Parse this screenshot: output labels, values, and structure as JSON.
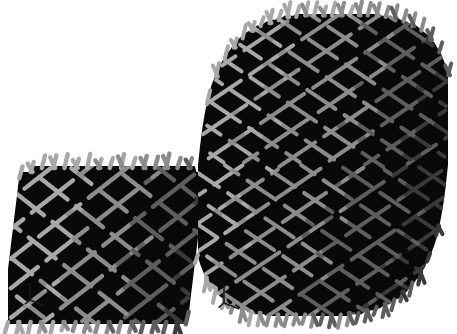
{
  "figure": {
    "background_color": "#ffffff",
    "caption": "",
    "render_type": "3d-woven-lattice-structures"
  },
  "palette": {
    "strand_light": "#a8a8a8",
    "strand_mid": "#8c8c8c",
    "strand_dark": "#5e5e5e",
    "strand_shadow": "#3a3a3a",
    "void_black": "#090909",
    "axis_color": "#1a1a1a",
    "background": "#ffffff"
  },
  "specimens": [
    {
      "id": "small-lattice",
      "name": "small-woven-lattice-specimen",
      "label": "",
      "bounds": {
        "x": 8,
        "y": 166,
        "width": 192,
        "height": 158
      },
      "shape": "cuboid",
      "weave": {
        "rows": 13,
        "cols": 15,
        "strand_thickness": 4.4,
        "diagonal_angle_a": -38,
        "diagonal_angle_b": 38
      },
      "axis_triad": {
        "name": "axis-triad-small",
        "origin": {
          "x": 30,
          "y": 300
        },
        "arm_length": 17,
        "axes": [
          "up",
          "right-down",
          "left-down"
        ]
      }
    },
    {
      "id": "large-lattice",
      "name": "large-woven-lattice-specimen",
      "label": "",
      "bounds": {
        "x": 198,
        "y": 12,
        "width": 250,
        "height": 306
      },
      "shape": "rounded-barrel",
      "weave": {
        "rows": 26,
        "cols": 24,
        "strand_thickness": 4.0,
        "diagonal_angle_a": -34,
        "diagonal_angle_b": 34,
        "seam_row": 13
      },
      "axis_triad": {
        "name": "axis-triad-large",
        "origin": {
          "x": 224,
          "y": 303
        },
        "arm_length": 18,
        "axes": [
          "up",
          "right-down",
          "left-down"
        ]
      }
    }
  ]
}
